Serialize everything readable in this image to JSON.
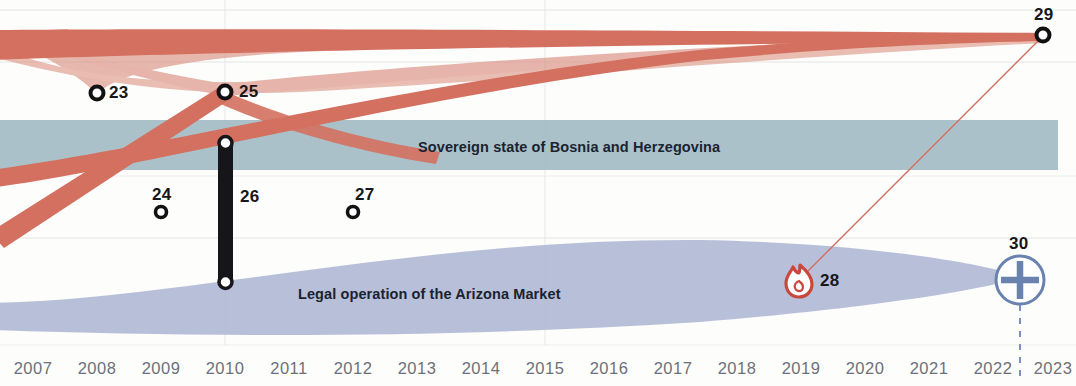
{
  "figure": {
    "type": "timeline-flow-diagram",
    "width": 1076,
    "height": 386
  },
  "colors": {
    "red_band": "#d4705f",
    "red_band_light": "#e0a294",
    "blue_band": "#a5bcc6",
    "lavender_band": "#b2bad6",
    "node_stroke": "#111114",
    "node_fill": "#ffffff",
    "black_bar": "#15151a",
    "plus_icon": "#6a82ae",
    "flame_icon": "#c8483c",
    "dashed_line": "#7b8ec4",
    "gridline": "#e2e2e2",
    "axis_text": "#6d7078",
    "band_text": "#1a2330"
  },
  "bands": [
    {
      "id": "sovereign-band",
      "label": "Sovereign state of Bosnia and Herzegovina",
      "color": "#a5bcc6",
      "label_x": 573,
      "label_y": 147
    },
    {
      "id": "arizona-band",
      "label": "Legal operation of the Arizona Market",
      "color": "#b2bad6",
      "label_x": 439,
      "label_y": 294
    }
  ],
  "nodes": [
    {
      "id": "23",
      "label": "23",
      "shape": "ring",
      "x": 97,
      "y": 93,
      "label_x": 110,
      "label_y": 84,
      "label_align": "left"
    },
    {
      "id": "24",
      "label": "24",
      "shape": "ring",
      "x": 161,
      "y": 212,
      "label_x": 161,
      "label_y": 186,
      "label_align": "center"
    },
    {
      "id": "25",
      "label": "25",
      "shape": "ring",
      "x": 225,
      "y": 92,
      "label_x": 239,
      "label_y": 83,
      "label_align": "left"
    },
    {
      "id": "26",
      "label": "26",
      "shape": "bar",
      "x": 225,
      "y": 142,
      "y2": 282,
      "label_x": 240,
      "label_y": 189,
      "label_align": "left"
    },
    {
      "id": "27",
      "label": "27",
      "shape": "ring",
      "x": 353,
      "y": 212,
      "label_x": 362,
      "label_y": 186,
      "label_align": "center"
    },
    {
      "id": "28",
      "label": "28",
      "shape": "flame",
      "x": 800,
      "y": 280,
      "label_x": 821,
      "label_y": 274,
      "label_align": "left"
    },
    {
      "id": "29",
      "label": "29",
      "shape": "ring",
      "x": 1043,
      "y": 35,
      "label_x": 1043,
      "label_y": 8,
      "label_align": "center"
    },
    {
      "id": "30",
      "label": "30",
      "shape": "plus",
      "x": 1020,
      "y": 280,
      "label_x": 1020,
      "label_y": 238,
      "label_align": "center"
    }
  ],
  "axis": {
    "label": "year",
    "years": [
      "2007",
      "2008",
      "2009",
      "2010",
      "2011",
      "2012",
      "2013",
      "2014",
      "2015",
      "2016",
      "2017",
      "2018",
      "2019",
      "2020",
      "2021",
      "2022",
      "2023"
    ],
    "x_positions": [
      33,
      97,
      161,
      225,
      289,
      353,
      417,
      481,
      545,
      609,
      673,
      737,
      801,
      865,
      929,
      993,
      1053
    ]
  },
  "gridlines": {
    "horizontal_y": [
      10,
      62,
      176,
      238,
      345
    ],
    "vertical_x": [
      225,
      545,
      1020
    ]
  },
  "chart_data": {
    "type": "area",
    "title": "",
    "xlabel": "",
    "ylabel": "",
    "x_range": [
      "2007",
      "2023"
    ],
    "series": [
      {
        "name": "Sovereign state of Bosnia and Herzegovina",
        "color": "#a5bcc6",
        "shape": "horizontal band",
        "y_top": 120,
        "y_bottom": 170,
        "x_start": 0,
        "x_end": 1058
      },
      {
        "name": "Legal operation of the Arizona Market",
        "color": "#b2bad6",
        "shape": "lens",
        "x_start": 0,
        "x_end": 1020,
        "peak_y_top": 240,
        "peak_y_bottom": 340
      },
      {
        "name": "red flow upper",
        "color": "#d4705f",
        "shape": "ribbon",
        "x_start": 0,
        "x_end": 1043
      },
      {
        "name": "red flow diagonal",
        "color": "#d4705f",
        "shape": "ribbon",
        "x_start": 0,
        "x_end": 1043
      }
    ]
  }
}
